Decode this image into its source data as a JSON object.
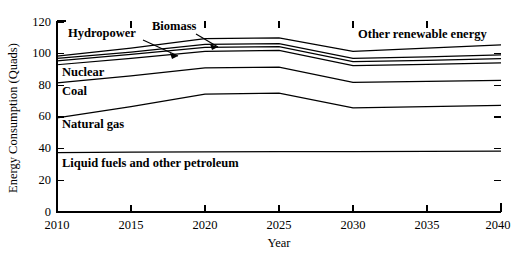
{
  "chart_data": {
    "type": "line",
    "title": "",
    "xlabel": "Year",
    "ylabel": "Energy Consumption (Quads)",
    "x": [
      2010,
      2015,
      2020,
      2025,
      2030,
      2035,
      2040
    ],
    "xlim": [
      2010,
      2040
    ],
    "ylim": [
      0,
      120
    ],
    "xticks": [
      "2010",
      "2015",
      "2020",
      "2025",
      "2030",
      "2035",
      "2040"
    ],
    "yticks": [
      "0",
      "20",
      "40",
      "60",
      "80",
      "100",
      "120"
    ],
    "grid": false,
    "legend_position": "inline-annotations",
    "series": [
      {
        "name": "Liquid fuels and other petroleum",
        "values": [
          37.5,
          37.8,
          38.0,
          38.2,
          38.2,
          38.3,
          38.4
        ]
      },
      {
        "name": "Natural gas",
        "values": [
          59.5,
          66.5,
          74.5,
          75.0,
          65.8,
          66.5,
          67.3
        ]
      },
      {
        "name": "Coal",
        "values": [
          81.5,
          86.0,
          91.0,
          91.5,
          81.8,
          82.5,
          83.2
        ]
      },
      {
        "name": "Nuclear",
        "values": [
          93.0,
          97.0,
          101.5,
          102.0,
          92.5,
          93.3,
          94.2
        ]
      },
      {
        "name": "Hydropower",
        "values": [
          95.5,
          99.5,
          104.0,
          104.5,
          95.0,
          95.8,
          96.8
        ]
      },
      {
        "name": "Biomass",
        "values": [
          97.0,
          101.0,
          105.8,
          106.3,
          97.0,
          98.0,
          99.2
        ]
      },
      {
        "name": "Other renewable energy",
        "values": [
          98.5,
          103.5,
          109.5,
          110.0,
          101.5,
          103.5,
          105.5
        ]
      }
    ],
    "annotations": [
      {
        "label": "Hydropower",
        "x_px": 68,
        "y_px": 37
      },
      {
        "label": "Biomass",
        "x_px": 152,
        "y_px": 30
      },
      {
        "label": "Other renewable energy",
        "x_px": 358,
        "y_px": 38
      },
      {
        "label": "Nuclear",
        "x_px": 62,
        "y_px": 76
      },
      {
        "label": "Coal",
        "x_px": 62,
        "y_px": 95
      },
      {
        "label": "Natural gas",
        "x_px": 62,
        "y_px": 128
      },
      {
        "label": "Liquid fuels and other petroleum",
        "x_px": 62,
        "y_px": 167
      }
    ],
    "colors": {
      "line": "#000000",
      "background": "#ffffff",
      "axis": "#000000"
    }
  }
}
